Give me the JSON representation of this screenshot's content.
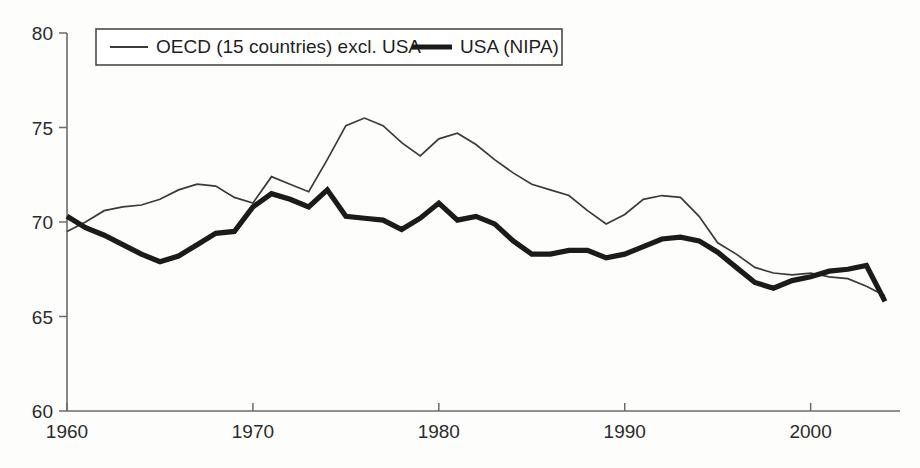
{
  "chart_data": {
    "type": "line",
    "title": "",
    "subtitle": "",
    "xlabel": "",
    "ylabel": "",
    "xlim": [
      1960,
      2004
    ],
    "ylim": [
      60,
      80
    ],
    "grid": false,
    "legend_position": "top-left-inside",
    "x_ticks": [
      "1960",
      "1970",
      "1980",
      "1990",
      "2000"
    ],
    "x_tick_values": [
      1960,
      1970,
      1980,
      1990,
      2000
    ],
    "y_ticks": [
      "60",
      "65",
      "70",
      "75",
      "80"
    ],
    "y_tick_values": [
      60,
      65,
      70,
      75,
      80
    ],
    "x": [
      1960,
      1961,
      1962,
      1963,
      1964,
      1965,
      1966,
      1967,
      1968,
      1969,
      1970,
      1971,
      1972,
      1973,
      1974,
      1975,
      1976,
      1977,
      1978,
      1979,
      1980,
      1981,
      1982,
      1983,
      1984,
      1985,
      1986,
      1987,
      1988,
      1989,
      1990,
      1991,
      1992,
      1993,
      1994,
      1995,
      1996,
      1997,
      1998,
      1999,
      2000,
      2001,
      2002,
      2003,
      2004
    ],
    "series": [
      {
        "name": "OECD (15 countries) excl. USA",
        "style": "thin",
        "color": "#3a3a3a",
        "values": [
          69.5,
          70.0,
          70.6,
          70.8,
          70.9,
          71.2,
          71.7,
          72.0,
          71.9,
          71.3,
          71.0,
          72.4,
          72.0,
          71.6,
          73.3,
          75.1,
          75.5,
          75.1,
          74.2,
          73.5,
          74.4,
          74.7,
          74.1,
          73.3,
          72.6,
          72.0,
          71.7,
          71.4,
          70.6,
          69.9,
          70.4,
          71.2,
          71.4,
          71.3,
          70.3,
          68.9,
          68.3,
          67.6,
          67.3,
          67.2,
          67.3,
          67.1,
          67.0,
          66.6,
          66.1
        ]
      },
      {
        "name": "USA (NIPA)",
        "style": "thick",
        "color": "#1b1b1b",
        "values": [
          70.3,
          69.7,
          69.3,
          68.8,
          68.3,
          67.9,
          68.2,
          68.8,
          69.4,
          69.5,
          70.8,
          71.5,
          71.2,
          70.8,
          71.7,
          70.3,
          70.2,
          70.1,
          69.6,
          70.2,
          71.0,
          70.1,
          70.3,
          69.9,
          69.0,
          68.3,
          68.3,
          68.5,
          68.5,
          68.1,
          68.3,
          68.7,
          69.1,
          69.2,
          69.0,
          68.4,
          67.6,
          66.8,
          66.5,
          66.9,
          67.1,
          67.4,
          67.5,
          67.7,
          65.8
        ]
      }
    ],
    "annotations": []
  },
  "legend": {
    "items": [
      {
        "label": "OECD (15 countries) excl. USA",
        "style": "thin"
      },
      {
        "label": "USA (NIPA)",
        "style": "thick"
      }
    ]
  },
  "colors": {
    "oecd_line": "#3a3a3a",
    "usa_line": "#1b1b1b",
    "axis": "#6b6b6b",
    "text": "#2b2b2b",
    "background": "#fdfdfc"
  }
}
